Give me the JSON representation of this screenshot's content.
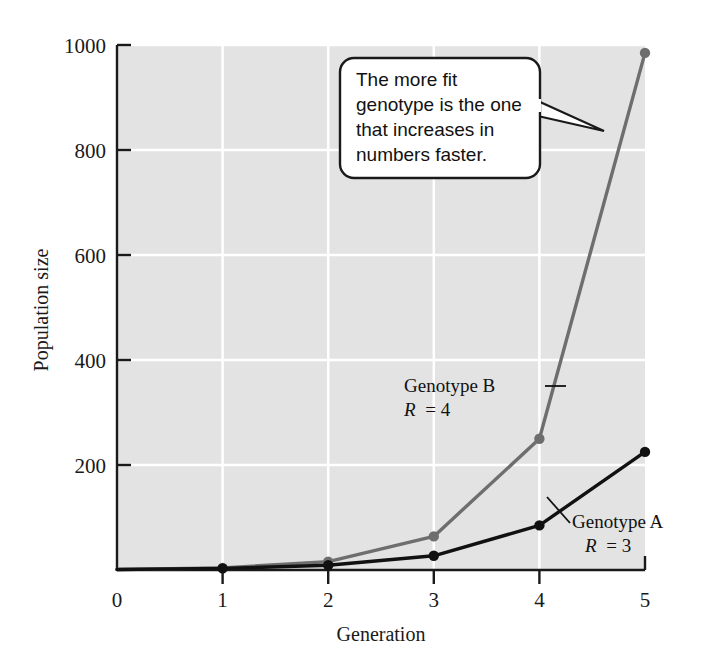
{
  "chart_data": {
    "type": "line",
    "title": "",
    "subtitle": "",
    "xlabel": "Generation",
    "ylabel": "Population size",
    "x": [
      0,
      1,
      2,
      3,
      4,
      5
    ],
    "xlim": [
      0,
      5
    ],
    "ylim": [
      0,
      1000
    ],
    "xticks": [
      "0",
      "1",
      "2",
      "3",
      "4",
      "5"
    ],
    "yticks": [
      "0",
      "200",
      "400",
      "600",
      "800",
      "1000"
    ],
    "grid": "white gridlines on light-gray plot background, horizontal at 200/400/600/800/1000 and vertical at 1/2/3/4",
    "legend_position": "inline labels on plot",
    "series": [
      {
        "name": "Genotype B",
        "label_line1": "Genotype B",
        "label_line2": "R = 4",
        "rate_symbol": "R",
        "rate_value": "4",
        "color": "#6e6e6e",
        "values": [
          1,
          4,
          16,
          64,
          250,
          985
        ]
      },
      {
        "name": "Genotype A",
        "label_line1": "Genotype A",
        "label_line2": "R = 3",
        "rate_symbol": "R",
        "rate_value": "3",
        "color": "#111111",
        "values": [
          1,
          3,
          9,
          27,
          85,
          225
        ]
      }
    ],
    "annotations": [
      {
        "id": "callout",
        "lines": [
          "The more fit",
          "genotype is the one",
          "that increases in",
          "numbers faster."
        ],
        "points_to": "Genotype B curve"
      }
    ]
  },
  "colors": {
    "plot_background": "#e3e3e3",
    "grid": "#ffffff",
    "axis": "#1a1a1a",
    "genotype_b": "#6e6e6e",
    "genotype_a": "#111111",
    "callout_border": "#1a1a1a",
    "callout_fill": "#ffffff",
    "page_background": "#ffffff"
  },
  "axes": {
    "y_title": "Population size",
    "x_title": "Generation",
    "y_tick_0": "0",
    "y_tick_200": "200",
    "y_tick_400": "400",
    "y_tick_600": "600",
    "y_tick_800": "800",
    "y_tick_1000": "1000",
    "x_tick_0": "0",
    "x_tick_1": "1",
    "x_tick_2": "2",
    "x_tick_3": "3",
    "x_tick_4": "4",
    "x_tick_5": "5"
  },
  "callout": {
    "line1": "The more fit",
    "line2": "genotype is the one",
    "line3": "that increases in",
    "line4": "numbers faster."
  },
  "labels": {
    "genotype_b_name": "Genotype B",
    "genotype_b_rate": "R = 4",
    "genotype_b_rate_symbol": "R",
    "genotype_b_rate_eq": "= 4",
    "genotype_a_name": "Genotype A",
    "genotype_a_rate": "R = 3",
    "genotype_a_rate_symbol": "R",
    "genotype_a_rate_eq": "= 3"
  }
}
